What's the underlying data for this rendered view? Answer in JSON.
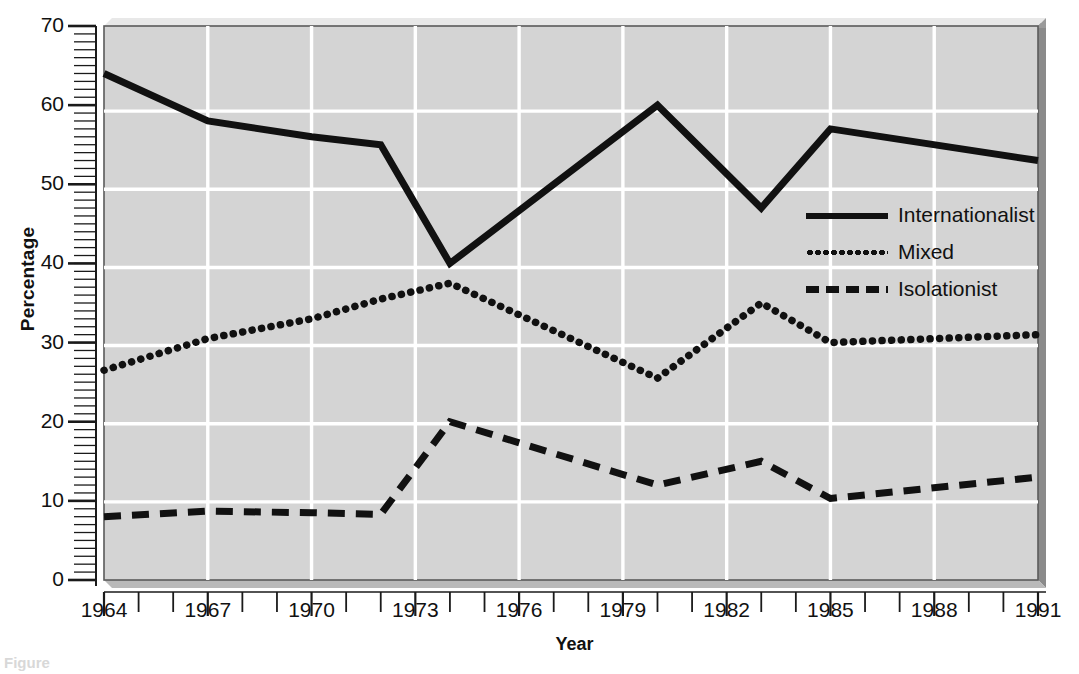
{
  "chart_data": {
    "type": "line",
    "title": "",
    "xlabel": "Year",
    "ylabel": "Percentage",
    "xlim": [
      1964,
      1991
    ],
    "ylim": [
      0,
      70
    ],
    "grid": true,
    "legend_position": "center-right",
    "x_tick_labels": [
      "1964",
      "1967",
      "1970",
      "1973",
      "1976",
      "1979",
      "1982",
      "1985",
      "1988",
      "1991"
    ],
    "x_tick_values": [
      1964,
      1967,
      1970,
      1973,
      1976,
      1979,
      1982,
      1985,
      1988,
      1991
    ],
    "y_tick_labels": [
      "0",
      "10",
      "20",
      "30",
      "40",
      "50",
      "60",
      "70"
    ],
    "y_tick_values": [
      0,
      10,
      20,
      30,
      40,
      50,
      60,
      70
    ],
    "y_minor_tick_step": 1,
    "x_minor_tick_step": 1,
    "series": [
      {
        "name": "Internationalist",
        "style": "solid",
        "color": "#111111",
        "x": [
          1964,
          1967,
          1970,
          1972,
          1974,
          1980,
          1983,
          1985,
          1991
        ],
        "values": [
          64,
          58,
          56,
          55,
          40,
          60,
          47,
          57,
          53
        ]
      },
      {
        "name": "Mixed",
        "style": "dotted",
        "color": "#111111",
        "x": [
          1964,
          1967,
          1970,
          1972,
          1974,
          1980,
          1983,
          1985,
          1991
        ],
        "values": [
          26.5,
          30.5,
          33,
          35.5,
          37.5,
          25.5,
          35,
          30,
          31
        ]
      },
      {
        "name": "Isolationist",
        "style": "dashed",
        "color": "#111111",
        "x": [
          1964,
          1967,
          1970,
          1972,
          1974,
          1980,
          1983,
          1985,
          1991
        ],
        "values": [
          8,
          8.7,
          8.5,
          8.3,
          20,
          12,
          15,
          10.3,
          13
        ]
      }
    ]
  },
  "axes": {
    "x_title": "Year",
    "y_title": "Percentage"
  },
  "legend": {
    "items": [
      {
        "label": "Internationalist",
        "style": "solid"
      },
      {
        "label": "Mixed",
        "style": "dotted"
      },
      {
        "label": "Isolationist",
        "style": "dashed"
      }
    ]
  },
  "colors": {
    "plot_background": "#d4d4d4",
    "grid": "#ffffff",
    "line": "#111111",
    "page_background": "#ffffff"
  },
  "caption": "Figure"
}
